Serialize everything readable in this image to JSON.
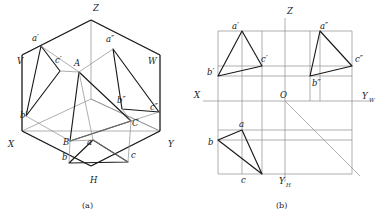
{
  "figure": {
    "background_color": "#ffffff",
    "ink_color": "#1a1a1a",
    "thin_color": "#8d8d8d",
    "captions": [
      {
        "id": "cap-a",
        "text": "(a)",
        "x": 88,
        "y": 207
      },
      {
        "id": "cap-b",
        "text": "(b)",
        "x": 281,
        "y": 207
      }
    ]
  },
  "panel_a": {
    "name": "pictorial-three-plane-view",
    "axis_labels": [
      {
        "id": "Z",
        "text": "Z",
        "x": 93,
        "y": 11
      },
      {
        "id": "X",
        "text": "X",
        "x": 8,
        "y": 147
      },
      {
        "id": "Y",
        "text": "Y",
        "x": 168,
        "y": 147
      },
      {
        "id": "V",
        "text": "V",
        "x": 17,
        "y": 64
      },
      {
        "id": "W",
        "text": "W",
        "x": 148,
        "y": 64
      },
      {
        "id": "H",
        "text": "H",
        "x": 90,
        "y": 183
      }
    ],
    "point_labels": [
      {
        "id": "a-prime",
        "text": "a′",
        "x": 32,
        "y": 41
      },
      {
        "id": "b-prime",
        "text": "b′",
        "x": 20,
        "y": 118
      },
      {
        "id": "c-prime",
        "text": "c′",
        "x": 55,
        "y": 63
      },
      {
        "id": "a-dblprime",
        "text": "a″",
        "x": 106,
        "y": 42
      },
      {
        "id": "b-dblprime",
        "text": "b″",
        "x": 117,
        "y": 103
      },
      {
        "id": "c-dblprime",
        "text": "c″",
        "x": 150,
        "y": 110
      },
      {
        "id": "A",
        "text": "A",
        "x": 74,
        "y": 66
      },
      {
        "id": "B",
        "text": "B",
        "x": 63,
        "y": 145
      },
      {
        "id": "C",
        "text": "C",
        "x": 132,
        "y": 126
      },
      {
        "id": "a",
        "text": "a",
        "x": 87,
        "y": 145
      },
      {
        "id": "b",
        "text": "b",
        "x": 62,
        "y": 160
      },
      {
        "id": "c",
        "text": "c",
        "x": 131,
        "y": 158
      }
    ]
  },
  "panel_b": {
    "name": "orthographic-three-view-layout",
    "axis_labels": [
      {
        "id": "Z",
        "text": "Z",
        "x": 287,
        "y": 14
      },
      {
        "id": "X",
        "text": "X",
        "x": 194,
        "y": 98
      },
      {
        "id": "O",
        "text": "O",
        "x": 280,
        "y": 98
      },
      {
        "id": "YW",
        "text": "Y",
        "sub": "W",
        "x": 366,
        "y": 99
      },
      {
        "id": "YH",
        "text": "Y",
        "sub": "H",
        "x": 283,
        "y": 184
      }
    ],
    "point_labels": [
      {
        "id": "a-prime",
        "text": "a′",
        "x": 232,
        "y": 30
      },
      {
        "id": "b-prime",
        "text": "b′",
        "x": 209,
        "y": 72
      },
      {
        "id": "c-prime",
        "text": "c′",
        "x": 261,
        "y": 61
      },
      {
        "id": "a-dblprime",
        "text": "a″",
        "x": 320,
        "y": 30
      },
      {
        "id": "b-dblprime",
        "text": "b″",
        "x": 326,
        "y": 80
      },
      {
        "id": "c-dblprime",
        "text": "c″",
        "x": 355,
        "y": 62
      },
      {
        "id": "a",
        "text": "a",
        "x": 238,
        "y": 130
      },
      {
        "id": "b",
        "text": "b",
        "x": 209,
        "y": 146
      },
      {
        "id": "c",
        "text": "c",
        "x": 242,
        "y": 180
      }
    ]
  }
}
